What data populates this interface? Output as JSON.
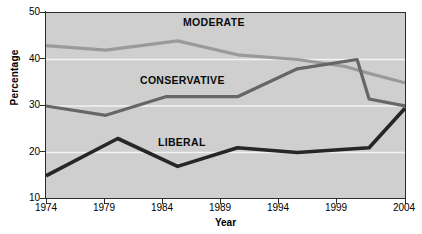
{
  "chart_data": {
    "type": "line",
    "title": "",
    "xlabel": "Year",
    "ylabel": "Percentage",
    "xlim": [
      1974,
      2004
    ],
    "ylim": [
      10,
      50
    ],
    "xticks": [
      1974,
      1979,
      1984,
      1989,
      1994,
      1999,
      2004
    ],
    "yticks": [
      10,
      20,
      30,
      40,
      50
    ],
    "grid": "horizontal-white-gridlines",
    "legend": "inline-labels-on-lines",
    "plot_background": "#cfcfcf",
    "series": [
      {
        "name": "MODERATE",
        "color": "#9a9a9a",
        "label_position": "above-line",
        "points": [
          [
            1974,
            43.0
          ],
          [
            1979,
            42.0
          ],
          [
            1985,
            44.0
          ],
          [
            1990,
            41.0
          ],
          [
            1995,
            40.0
          ],
          [
            1999,
            38.5
          ],
          [
            2001,
            37.0
          ],
          [
            2004,
            35.0
          ]
        ]
      },
      {
        "name": "CONSERVATIVE",
        "color": "#666666",
        "label_position": "above-line",
        "points": [
          [
            1974,
            30.0
          ],
          [
            1979,
            28.0
          ],
          [
            1984,
            32.0
          ],
          [
            1990,
            32.0
          ],
          [
            1995,
            38.0
          ],
          [
            2000,
            40.0
          ],
          [
            2001,
            31.5
          ],
          [
            2004,
            30.0
          ]
        ]
      },
      {
        "name": "LIBERAL",
        "color": "#262626",
        "label_position": "above-line",
        "points": [
          [
            1974,
            15.0
          ],
          [
            1980,
            23.0
          ],
          [
            1985,
            17.0
          ],
          [
            1990,
            21.0
          ],
          [
            1995,
            20.0
          ],
          [
            2001,
            21.0
          ],
          [
            2004,
            29.5
          ]
        ]
      }
    ]
  },
  "axes": {
    "y_title": "Percentage",
    "x_title": "Year",
    "y_tick_labels": [
      "50",
      "40",
      "30",
      "20",
      "10"
    ],
    "x_tick_labels": [
      "1974",
      "1979",
      "1984",
      "1989",
      "1994",
      "1999",
      "2004"
    ]
  },
  "series_labels": {
    "moderate": "MODERATE",
    "conservative": "CONSERVATIVE",
    "liberal": "LIBERAL"
  }
}
